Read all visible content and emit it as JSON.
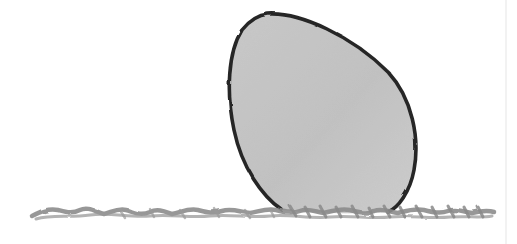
{
  "image": {
    "description": "Pencil sketch of a grey-shaded egg resting on a scribbled ground line",
    "background": "#ffffff",
    "egg": {
      "fill": "#c4c4c4",
      "fill_light": "#d9d9d9",
      "outline": "#2a2a2a"
    },
    "ground": {
      "color": "#8f8f8f"
    }
  }
}
